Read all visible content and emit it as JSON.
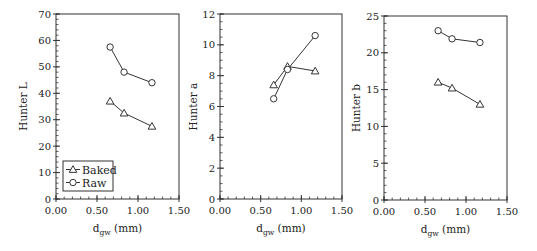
{
  "chart_data": [
    {
      "type": "line",
      "title": "",
      "xlabel": "d_gw (mm)",
      "ylabel": "Hunter L",
      "xlim": [
        0,
        1.5
      ],
      "ylim": [
        0,
        70
      ],
      "xticks": [
        0.0,
        0.5,
        1.0,
        1.5
      ],
      "xtick_labels": [
        "0.00",
        "0.50",
        "1.00",
        "1.50"
      ],
      "yticks": [
        0,
        10,
        20,
        30,
        40,
        50,
        60,
        70
      ],
      "ytick_labels": [
        "0",
        "10",
        "20",
        "30",
        "40",
        "50",
        "60",
        "70"
      ],
      "y_minor_step": 2,
      "x_minor_step": 0.1,
      "grid": false,
      "legend": {
        "position": "lower left",
        "entries": [
          "Baked",
          "Raw"
        ]
      },
      "series": [
        {
          "name": "Baked",
          "marker": "triangle",
          "x": [
            0.66,
            0.83,
            1.17
          ],
          "values": [
            37.0,
            32.5,
            27.5
          ]
        },
        {
          "name": "Raw",
          "marker": "circle",
          "x": [
            0.66,
            0.83,
            1.17
          ],
          "values": [
            57.5,
            48.0,
            44.0
          ]
        }
      ]
    },
    {
      "type": "line",
      "title": "",
      "xlabel": "d_gw (mm)",
      "ylabel": "Hunter a",
      "xlim": [
        0,
        1.5
      ],
      "ylim": [
        0,
        12
      ],
      "xticks": [
        0.0,
        0.5,
        1.0,
        1.5
      ],
      "xtick_labels": [
        "0.00",
        "0.50",
        "1.00",
        "1.50"
      ],
      "yticks": [
        0,
        2,
        4,
        6,
        8,
        10,
        12
      ],
      "ytick_labels": [
        "0",
        "2",
        "4",
        "6",
        "8",
        "10",
        "12"
      ],
      "y_minor_step": 0.5,
      "x_minor_step": 0.1,
      "grid": false,
      "legend": null,
      "series": [
        {
          "name": "Baked",
          "marker": "triangle",
          "x": [
            0.66,
            0.83,
            1.17
          ],
          "values": [
            7.4,
            8.6,
            8.3
          ]
        },
        {
          "name": "Raw",
          "marker": "circle",
          "x": [
            0.66,
            0.83,
            1.17
          ],
          "values": [
            6.5,
            8.4,
            10.6
          ]
        }
      ]
    },
    {
      "type": "line",
      "title": "",
      "xlabel": "d_gw (mm)",
      "ylabel": "Hunter b",
      "xlim": [
        0,
        1.5
      ],
      "ylim": [
        0,
        25
      ],
      "xticks": [
        0.0,
        0.5,
        1.0,
        1.5
      ],
      "xtick_labels": [
        "0.00",
        "0.50",
        "1.00",
        "1.50"
      ],
      "yticks": [
        0,
        5,
        10,
        15,
        20,
        25
      ],
      "ytick_labels": [
        "0",
        "5",
        "10",
        "15",
        "20",
        "25"
      ],
      "y_minor_step": 1,
      "x_minor_step": 0.1,
      "grid": false,
      "legend": null,
      "series": [
        {
          "name": "Baked",
          "marker": "triangle",
          "x": [
            0.66,
            0.83,
            1.17
          ],
          "values": [
            16.0,
            15.2,
            13.0
          ]
        },
        {
          "name": "Raw",
          "marker": "circle",
          "x": [
            0.66,
            0.83,
            1.17
          ],
          "values": [
            23.0,
            21.9,
            21.4
          ]
        }
      ]
    }
  ],
  "figure": {
    "xlabel_main": "d",
    "xlabel_sub": "gw",
    "xlabel_unit": " (mm)",
    "colors": {
      "line": "#333333",
      "axis": "#333333",
      "marker_fill": "#ffffff"
    }
  }
}
